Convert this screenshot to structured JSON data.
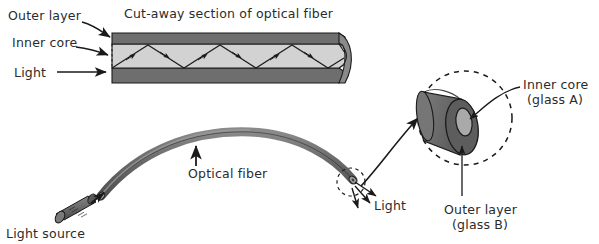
{
  "figure": {
    "title": "Cut-away section of optical fiber",
    "colors": {
      "outer_layer_fill": "#6e6e6e",
      "inner_core_fill": "#c9c9c9",
      "cylinder_body": "#6b6b6b",
      "cylinder_face": "#595959",
      "core_face": "#a8a8a8",
      "fiber_tube": "#6e6e6e",
      "stroke": "#1a1a1a",
      "text": "#2b2b2b",
      "background": "#ffffff"
    }
  },
  "cutaway": {
    "title": "Cut-away section of optical fiber",
    "labels": {
      "outer_layer": "Outer layer",
      "inner_core": "Inner core",
      "light": "Light"
    }
  },
  "fiber_scene": {
    "labels": {
      "optical_fiber": "Optical fiber",
      "light_source": "Light source",
      "light_out": "Light"
    }
  },
  "magnified": {
    "labels": {
      "inner_core_line1": "Inner core",
      "inner_core_line2": "(glass A)",
      "outer_layer_line1": "Outer layer",
      "outer_layer_line2": "(glass B)"
    }
  }
}
